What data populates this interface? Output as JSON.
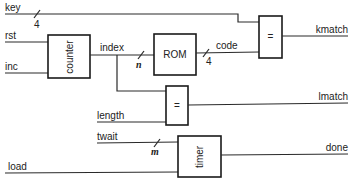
{
  "signals": {
    "key": "key",
    "rst": "rst",
    "inc": "inc",
    "index": "index",
    "code": "code",
    "length": "length",
    "twait": "twait",
    "load": "load",
    "kmatch": "kmatch",
    "lmatch": "lmatch",
    "done": "done"
  },
  "blocks": {
    "counter": "counter",
    "rom": "ROM",
    "key_compare": "=",
    "length_compare": "=",
    "timer": "timer"
  },
  "bus_widths": {
    "key": "4",
    "index": "n",
    "code": "4",
    "twait": "m"
  },
  "colors": {
    "line": "#2a2a2a",
    "background": "#ffffff"
  }
}
